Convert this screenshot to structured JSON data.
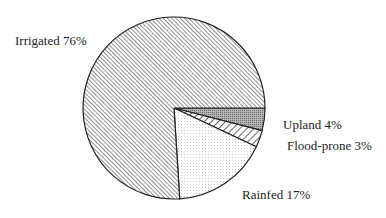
{
  "chart_data": {
    "type": "pie",
    "title": "",
    "categories": [
      "Upland",
      "Flood-prone",
      "Rainfed",
      "Irrigated"
    ],
    "values": [
      4,
      3,
      17,
      76
    ],
    "unit": "%",
    "start_angle_deg": 0,
    "direction": "clockwise",
    "fills": [
      "dense-dot-gray",
      "wide-diagonal-hatch",
      "light-stipple",
      "fine-diagonal-hatch"
    ],
    "labels": [
      {
        "name": "Upland",
        "text": "Upland 4%"
      },
      {
        "name": "Flood-prone",
        "text": "Flood-prone 3%"
      },
      {
        "name": "Rainfed",
        "text": "Rainfed 17%"
      },
      {
        "name": "Irrigated",
        "text": "Irrigated 76%"
      }
    ],
    "legend": "none (direct labels)"
  }
}
